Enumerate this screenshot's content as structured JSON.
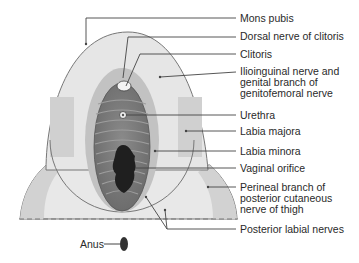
{
  "diagram": {
    "type": "anatomical-illustration",
    "labels": [
      {
        "id": "mons-pubis",
        "text": "Mons pubis",
        "lines": [
          "Mons pubis"
        ]
      },
      {
        "id": "dorsal-nerve",
        "text": "Dorsal nerve of clitoris",
        "lines": [
          "Dorsal nerve of clitoris"
        ]
      },
      {
        "id": "clitoris",
        "text": "Clitoris",
        "lines": [
          "Clitoris"
        ]
      },
      {
        "id": "ilioinguinal",
        "text": "Ilioinguinal nerve and genital branch of genitofemoral nerve",
        "lines": [
          "Ilioinguinal nerve and",
          "genital branch of",
          "genitofemoral nerve"
        ]
      },
      {
        "id": "urethra",
        "text": "Urethra",
        "lines": [
          "Urethra"
        ]
      },
      {
        "id": "labia-majora",
        "text": "Labia majora",
        "lines": [
          "Labia majora"
        ]
      },
      {
        "id": "labia-minora",
        "text": "Labia minora",
        "lines": [
          "Labia minora"
        ]
      },
      {
        "id": "vaginal-orifice",
        "text": "Vaginal orifice",
        "lines": [
          "Vaginal orifice"
        ]
      },
      {
        "id": "perineal-branch",
        "text": "Perineal branch of posterior cutaneous nerve of thigh",
        "lines": [
          "Perineal branch of",
          "posterior cutaneous",
          "nerve of thigh"
        ]
      },
      {
        "id": "posterior-labial",
        "text": "Posterior labial nerves",
        "lines": [
          "Posterior labial nerves"
        ]
      }
    ],
    "anus_label": "Anus",
    "colors": {
      "outline": "#6e6e6e",
      "light_fill": "#e6e6e6",
      "mid_fill": "#cdcdcd",
      "inner_fill": "#9a9a9a",
      "dark_fill": "#1f1f1f",
      "text": "#2a2a2a"
    }
  }
}
